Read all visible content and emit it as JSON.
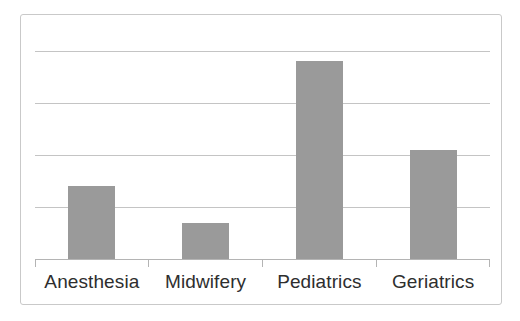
{
  "chart_data": {
    "type": "bar",
    "title": "",
    "subtitle": "",
    "xlabel": "",
    "ylabel": "",
    "categories": [
      "Anesthesia",
      "Midwifery",
      "Pediatrics",
      "Geriatrics"
    ],
    "values": [
      1.4,
      0.7,
      3.8,
      2.1
    ],
    "series": [
      {
        "name": "",
        "values": [
          1.4,
          0.7,
          3.8,
          2.1
        ]
      }
    ],
    "ylim": [
      0,
      4.4
    ],
    "yticks": [
      0,
      1,
      2,
      3,
      4
    ],
    "ytick_labels": [
      "",
      "",
      "",
      "",
      ""
    ],
    "grid": true,
    "gridlines_y": [
      1,
      2,
      3,
      4
    ],
    "legend": false,
    "legend_position": "none",
    "annotations": [],
    "bar_color": "#9a9a9a",
    "gridline_color": "#c4c4c4",
    "axis_color": "#b4b4b4",
    "frame_color": "#c9c9c9",
    "label_color": "#2e2e2e",
    "background_color": "#ffffff"
  },
  "figure": {
    "frame_visible": true,
    "axis_visible": true,
    "tick_marks": 5
  }
}
